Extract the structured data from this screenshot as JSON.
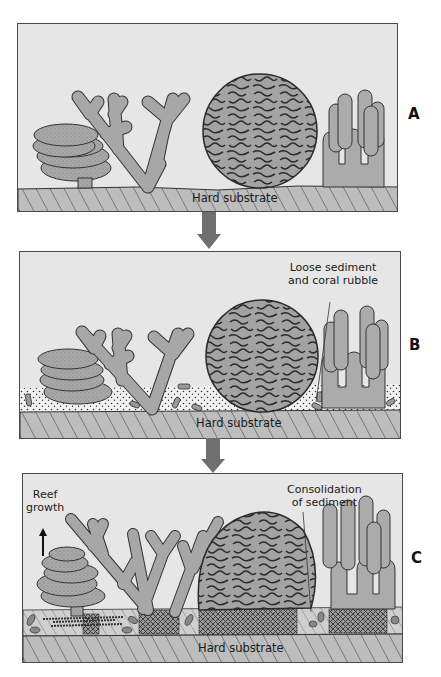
{
  "figure": {
    "colors": {
      "water": "#e6e6e6",
      "substrate": "#bdbdbd",
      "coral_fill": "#a9a9a9",
      "outline": "#333333",
      "arrow": "#6f6f6f",
      "sediment_bg": "#f2f2f2"
    },
    "panels": [
      {
        "id": "A",
        "label": "A",
        "substrate_label": "Hard substrate",
        "annotation": null
      },
      {
        "id": "B",
        "label": "B",
        "substrate_label": "Hard substrate",
        "annotation": {
          "line1": "Loose sediment",
          "line2": "and coral rubble"
        }
      },
      {
        "id": "C",
        "label": "C",
        "substrate_label": "Hard substrate",
        "annotation": {
          "line1": "Consolidation",
          "line2": "of sediment"
        },
        "growth": {
          "line1": "Reef",
          "line2": "growth",
          "icon": "up-arrow-icon"
        }
      }
    ],
    "transitions": [
      {
        "from": "A",
        "to": "B",
        "icon": "down-arrow-icon"
      },
      {
        "from": "B",
        "to": "C",
        "icon": "down-arrow-icon"
      }
    ],
    "corals": [
      "plate-coral",
      "staghorn-coral",
      "brain-coral",
      "pillar-coral"
    ]
  }
}
